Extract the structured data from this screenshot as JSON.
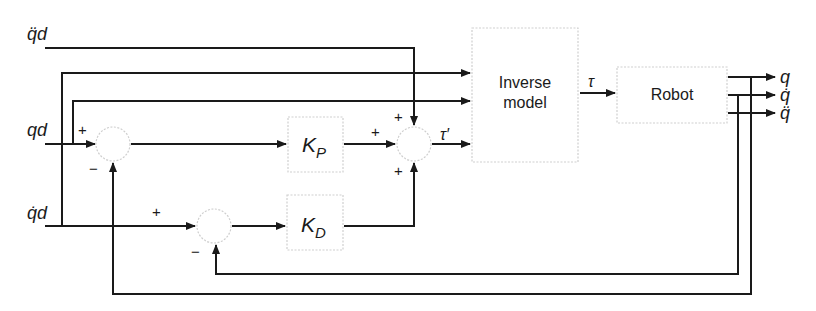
{
  "diagram": {
    "type": "block-diagram",
    "title": "",
    "inputs": {
      "acc_desired": "q̈d",
      "pos_desired": "qd",
      "vel_desired": "q̇d"
    },
    "blocks": {
      "kp": {
        "label": "K",
        "sub": "P"
      },
      "kd": {
        "label": "K",
        "sub": "D"
      },
      "inverse_model": {
        "line1": "Inverse",
        "line2": "model"
      },
      "robot": {
        "label": "Robot"
      }
    },
    "signals": {
      "tau_prime": "τ′",
      "tau": "τ"
    },
    "outputs": {
      "q": "q",
      "q_dot": "q̇",
      "q_ddot": "q̈"
    },
    "signs": {
      "sum1_plus": "+",
      "sum1_minus": "−",
      "sum2_top_plus": "+",
      "sum2_left_plus": "+",
      "sum2_bottom_plus": "+",
      "sum3_plus": "+",
      "sum3_minus": "−"
    },
    "colors": {
      "wire": "#1a1a1a",
      "block_border": "#cfcfcf",
      "background": "#ffffff"
    }
  }
}
